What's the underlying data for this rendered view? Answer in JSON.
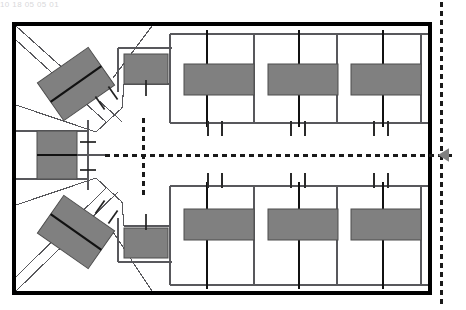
{
  "document": {
    "title": "Parking Facility Site Plan",
    "header_fragment": "10  18 05 05 01"
  },
  "colors": {
    "stall_fill": "#808080",
    "stall_stroke": "#4d4d4d",
    "frame_stroke": "#000000",
    "thin_line": "#58585c",
    "dashed_line": "#1a1a1a",
    "marker_fill": "#808080",
    "background": "#ffffff"
  },
  "frame": {
    "label": "site-boundary",
    "x": 14,
    "y": 24,
    "width": 416,
    "height": 269,
    "stroke_width": 4
  },
  "axes": {
    "vertical_right": {
      "label": "right-section-axis",
      "x": 441,
      "y1": 2,
      "y2": 308
    },
    "vertical_inner": {
      "label": "inner-section-axis",
      "x": 143,
      "y1": 118,
      "y2": 196
    },
    "horizontal_main": {
      "label": "main-centerline-axis",
      "y": 155,
      "x1": 105,
      "x2": 455
    },
    "dash_pattern": "5 4",
    "stroke_width": 3
  },
  "direction_marker": {
    "label": "view-direction-arrow",
    "shape": "triangle-left",
    "x": 449,
    "y": 155,
    "size": 11
  },
  "angled_stalls": [
    {
      "label": "angled-stall-upper",
      "cx": 76,
      "cy": 84,
      "w": 62,
      "h": 46,
      "rotation": -35
    },
    {
      "label": "angled-stall-lower",
      "cx": 76,
      "cy": 232,
      "w": 62,
      "h": 46,
      "rotation": 35
    }
  ],
  "edge_stalls": [
    {
      "label": "edge-stall-upper",
      "x": 124,
      "y": 54,
      "w": 44,
      "h": 30
    },
    {
      "label": "edge-stall-middle",
      "x": 37,
      "y": 131,
      "w": 40,
      "h": 48
    },
    {
      "label": "edge-stall-lower",
      "x": 124,
      "y": 228,
      "w": 44,
      "h": 30
    }
  ],
  "bays": {
    "upper": {
      "label": "upper-parking-bay-row",
      "band_top": 34,
      "band_bottom": 123,
      "stall_y": 64,
      "stall_h": 31,
      "stalls": [
        {
          "label": "bay-stall-u1",
          "x": 184,
          "w": 70
        },
        {
          "label": "bay-stall-u2",
          "x": 268,
          "w": 70
        },
        {
          "label": "bay-stall-u3",
          "x": 351,
          "w": 70
        }
      ],
      "dividers": [
        170,
        207,
        254,
        299,
        337,
        383,
        421
      ],
      "curb_y": 123,
      "ticks": [
        208,
        222,
        291,
        305,
        374,
        388
      ],
      "tick_dir": "down"
    },
    "lower": {
      "label": "lower-parking-bay-row",
      "band_top": 186,
      "band_bottom": 285,
      "stall_y": 209,
      "stall_h": 31,
      "stalls": [
        {
          "label": "bay-stall-l1",
          "x": 184,
          "w": 70
        },
        {
          "label": "bay-stall-l2",
          "x": 268,
          "w": 70
        },
        {
          "label": "bay-stall-l3",
          "x": 351,
          "w": 70
        }
      ],
      "dividers": [
        170,
        207,
        254,
        299,
        337,
        383,
        421
      ],
      "curb_y": 186,
      "ticks": [
        208,
        222,
        291,
        305,
        374,
        388
      ],
      "tick_dir": "up"
    }
  },
  "aisle_ticks": [
    {
      "label": "aisle-tick-u1",
      "cx": 100,
      "cy": 103,
      "angle": -35
    },
    {
      "label": "aisle-tick-u2",
      "cx": 113,
      "cy": 93,
      "angle": -35
    },
    {
      "label": "aisle-tick-l1",
      "cx": 100,
      "cy": 207,
      "angle": 35
    },
    {
      "label": "aisle-tick-l2",
      "cx": 113,
      "cy": 217,
      "angle": 35
    },
    {
      "label": "aisle-tick-left-upper",
      "cx": 88,
      "cy": 142,
      "angle": 90
    },
    {
      "label": "aisle-tick-left-lower",
      "cx": 88,
      "cy": 170,
      "angle": 90
    },
    {
      "label": "aisle-tick-stall-upper",
      "cx": 146,
      "cy": 88,
      "angle": 0
    },
    {
      "label": "aisle-tick-stall-lower",
      "cx": 146,
      "cy": 222,
      "angle": 0
    }
  ]
}
